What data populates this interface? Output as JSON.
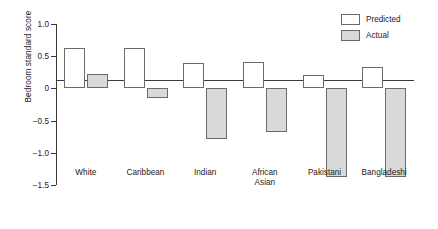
{
  "chart_data": {
    "type": "bar",
    "title": "",
    "xlabel": "",
    "ylabel": "Bedroom standard score",
    "ylim": [
      -1.5,
      1.0
    ],
    "yticks": [
      "1.0",
      "0.5",
      "0",
      "-0.5",
      "-1.0",
      "-1.5"
    ],
    "ytick_values": [
      1.0,
      0.5,
      0,
      -0.5,
      -1.0,
      -1.5
    ],
    "grid": false,
    "legend_position": "top-right",
    "categories": [
      "White",
      "Caribbean",
      "Indian",
      "African Asian",
      "Pakistani",
      "Bangladeshi"
    ],
    "category_lines": [
      [
        "White"
      ],
      [
        "Caribbean"
      ],
      [
        "Indian"
      ],
      [
        "African",
        "Asian"
      ],
      [
        "Pakistani"
      ],
      [
        "Bangladeshi"
      ]
    ],
    "series": [
      {
        "name": "Predicted",
        "color": "#ffffff",
        "values": [
          0.63,
          0.63,
          0.4,
          0.41,
          0.21,
          0.34
        ]
      },
      {
        "name": "Actual",
        "color": "#d9d9d9",
        "values": [
          0.22,
          -0.15,
          -0.78,
          -0.67,
          -1.37,
          -1.37
        ]
      }
    ]
  },
  "legend": {
    "items": [
      {
        "label": "Predicted",
        "swatch": "predicted"
      },
      {
        "label": "Actual",
        "swatch": "actual"
      }
    ]
  },
  "axis": {
    "y_title": "Bedroom standard score"
  }
}
